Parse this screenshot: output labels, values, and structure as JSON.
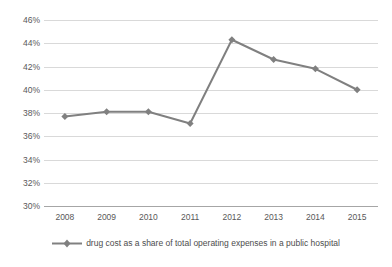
{
  "chart_data": {
    "type": "line",
    "title": "",
    "xlabel": "",
    "ylabel": "",
    "categories": [
      "2008",
      "2009",
      "2010",
      "2011",
      "2012",
      "2013",
      "2014",
      "2015"
    ],
    "series": [
      {
        "name": "drug cost as a share of total operating expenses in a public hospital",
        "values": [
          37.7,
          38.1,
          38.1,
          37.1,
          44.3,
          42.6,
          41.8,
          40.0
        ]
      }
    ],
    "ylim": [
      30,
      46
    ],
    "ytick_step": 2,
    "ytick_labels": [
      "46%",
      "44%",
      "42%",
      "40%",
      "38%",
      "36%",
      "34%",
      "32%",
      "30%"
    ],
    "ytick_values": [
      46,
      44,
      42,
      40,
      38,
      36,
      34,
      32,
      30
    ],
    "grid": true,
    "legend_position": "bottom",
    "series_color": "#808080",
    "gridline_color": "#d9d9d9",
    "axis_color": "#a6a6a6",
    "text_color": "#595959",
    "marker": "diamond"
  },
  "legend": {
    "marker_name": "diamond-marker",
    "label": "drug cost as a share of total operating expenses in a public hospital"
  }
}
